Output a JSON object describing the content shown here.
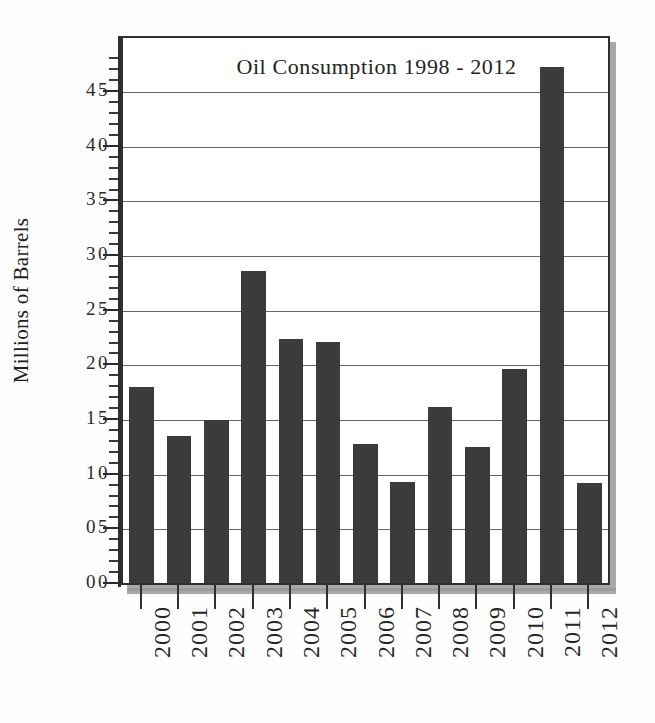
{
  "chart_data": {
    "type": "bar",
    "title": "Oil Consumption 1998 - 2012",
    "xlabel": "",
    "ylabel": "Millions of Barrels",
    "categories": [
      "2000",
      "2001",
      "2002",
      "2003",
      "2004",
      "2005",
      "2006",
      "2007",
      "2008",
      "2009",
      "2010",
      "2011",
      "2012"
    ],
    "values": [
      18.0,
      13.5,
      15.0,
      28.6,
      22.4,
      22.1,
      12.8,
      9.3,
      16.2,
      12.5,
      19.7,
      47.3,
      9.2
    ],
    "ylim": [
      0,
      50
    ],
    "ytick_labels": [
      "00",
      "05",
      "10",
      "15",
      "20",
      "25",
      "30",
      "35",
      "40",
      "45"
    ],
    "ytick_values": [
      0,
      5,
      10,
      15,
      20,
      25,
      30,
      35,
      40,
      45
    ],
    "minor_tick_step": 1,
    "grid": true,
    "grid_axis": "y",
    "legend": "none",
    "bar_color": "#3b3b3b",
    "frame_color": "#2f2f2f",
    "shadow_color": "#9a9a9a",
    "background_color": "#ffffff"
  }
}
